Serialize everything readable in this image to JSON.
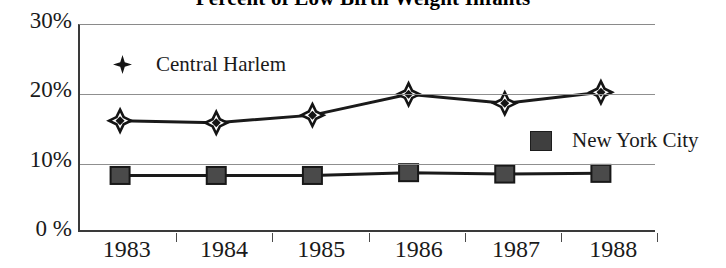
{
  "chart_data": {
    "type": "line",
    "title": "Percent of Low Birth Weight Infants",
    "xlabel": "",
    "ylabel": "",
    "categories": [
      "1983",
      "1984",
      "1985",
      "1986",
      "1987",
      "1988"
    ],
    "ylim": [
      0,
      30
    ],
    "yticks": [
      0,
      10,
      20,
      30
    ],
    "ytick_labels": [
      "0 %",
      "10%",
      "20%",
      "30%"
    ],
    "grid": true,
    "legend_position": "inside-plot",
    "series": [
      {
        "name": "Central Harlem",
        "marker": "diamond",
        "color": "#141414",
        "values": [
          16.2,
          15.9,
          17.0,
          20.0,
          18.7,
          20.3
        ]
      },
      {
        "name": "New York City",
        "marker": "square",
        "color": "#3f3f3f",
        "values": [
          8.3,
          8.3,
          8.3,
          8.7,
          8.5,
          8.6
        ]
      }
    ]
  },
  "axis": {
    "y_labels": [
      "30%",
      "20%",
      "10%",
      "0 %"
    ],
    "x_labels": [
      "1983",
      "1984",
      "1985",
      "1986",
      "1987",
      "1988"
    ]
  },
  "legend": {
    "central_harlem": "Central Harlem",
    "new_york_city": "New York City"
  }
}
